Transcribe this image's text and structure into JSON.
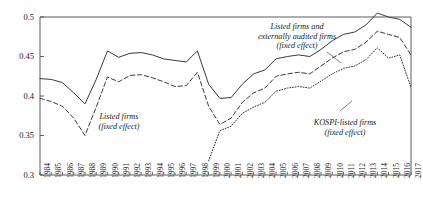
{
  "chart_data": {
    "type": "line",
    "title": "",
    "subtitle": "",
    "xlabel": "",
    "ylabel": "",
    "xlim": [
      1984,
      2017
    ],
    "ylim": [
      0.3,
      0.5
    ],
    "grid": false,
    "legend_position": "inline-annotations",
    "y_ticks": [
      "0.3",
      "0.35",
      "0.4",
      "0.45",
      "0.5"
    ],
    "y_tick_values": [
      0.3,
      0.35,
      0.4,
      0.45,
      0.5
    ],
    "x": [
      1984,
      1985,
      1986,
      1987,
      1988,
      1989,
      1990,
      1991,
      1992,
      1993,
      1994,
      1995,
      1996,
      1997,
      1998,
      1999,
      2000,
      2001,
      2002,
      2003,
      2004,
      2005,
      2006,
      2007,
      2008,
      2009,
      2010,
      2011,
      2012,
      2013,
      2014,
      2015,
      2016,
      2017
    ],
    "x_tick_labels": [
      "1984",
      "1985",
      "1986",
      "1987",
      "1988",
      "1989",
      "1990",
      "1991",
      "1992",
      "1993",
      "1994",
      "1995",
      "1996",
      "1997",
      "1998",
      "1999",
      "2000",
      "2001",
      "2002",
      "2003",
      "2004",
      "2005",
      "2006",
      "2007",
      "2008",
      "2009",
      "2010",
      "2011",
      "2012",
      "2013",
      "2014",
      "2015",
      "2016",
      "2017"
    ],
    "series": [
      {
        "name": "Listed firms and externally audited firms (fixed effect)",
        "style": "solid",
        "color": "#3a3a3a",
        "values": [
          0.422,
          0.421,
          0.417,
          0.404,
          0.39,
          0.421,
          0.457,
          0.449,
          0.454,
          0.455,
          0.452,
          0.447,
          0.445,
          0.443,
          0.457,
          0.415,
          0.397,
          0.398,
          0.415,
          0.428,
          0.433,
          0.447,
          0.45,
          0.452,
          0.45,
          0.459,
          0.47,
          0.478,
          0.481,
          0.49,
          0.505,
          0.5,
          0.497,
          0.487
        ]
      },
      {
        "name": "Listed firms (fixed effect)",
        "style": "dashed",
        "color": "#3a3a3a",
        "values": [
          0.397,
          0.393,
          0.387,
          0.372,
          0.35,
          0.386,
          0.424,
          0.418,
          0.426,
          0.427,
          0.423,
          0.418,
          0.412,
          0.413,
          0.43,
          0.387,
          0.364,
          0.372,
          0.392,
          0.404,
          0.41,
          0.425,
          0.428,
          0.43,
          0.428,
          0.438,
          0.448,
          0.456,
          0.459,
          0.468,
          0.482,
          0.478,
          0.474,
          0.452
        ]
      },
      {
        "name": "KOSPI-listed firms (fixed effect)",
        "style": "dotted",
        "color": "#3a3a3a",
        "values": [
          null,
          null,
          null,
          null,
          null,
          null,
          null,
          null,
          null,
          null,
          null,
          null,
          null,
          null,
          null,
          0.318,
          0.356,
          0.362,
          0.378,
          0.386,
          0.392,
          0.406,
          0.41,
          0.412,
          0.41,
          0.419,
          0.428,
          0.435,
          0.438,
          0.446,
          0.461,
          0.448,
          0.452,
          0.411
        ]
      }
    ],
    "annotations": [
      {
        "id": "annot-listed-firms",
        "lines": [
          "Listed firms",
          "(fixed effect)"
        ],
        "x_px": 119,
        "y_px": 112
      },
      {
        "id": "annot-listed-and-audited",
        "lines": [
          "Listed firms and",
          "externally audited firms",
          "(fixed effect)"
        ],
        "x_px": 297,
        "y_px": 22
      },
      {
        "id": "annot-kospi-listed",
        "lines": [
          "KOSPI-listed firms",
          "(fixed effect)"
        ],
        "x_px": 345,
        "y_px": 118
      }
    ]
  }
}
